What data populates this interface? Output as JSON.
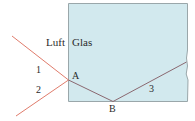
{
  "diagram": {
    "type": "light-refraction-reflection",
    "media": {
      "left": "Luft",
      "right": "Glas"
    },
    "points": {
      "A": "A",
      "B": "B"
    },
    "rays": {
      "ray1": "1",
      "ray2": "2",
      "ray3": "3"
    },
    "colors": {
      "glass_fill": "#d2e9ee",
      "glass_border": "#9aa7aa",
      "ray_outside": "#e07c6c",
      "ray_inside": "#8a6870",
      "label": "#2a2a2a"
    }
  }
}
